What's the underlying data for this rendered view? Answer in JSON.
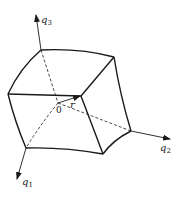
{
  "diagram": {
    "colors": {
      "stroke": "#1a1a1a",
      "background": "#ffffff"
    },
    "axes": [
      {
        "id": "q1",
        "symbol": "q",
        "subscript": "1"
      },
      {
        "id": "q2",
        "symbol": "q",
        "subscript": "2"
      },
      {
        "id": "q3",
        "symbol": "q",
        "subscript": "3"
      }
    ],
    "origin_label": "0",
    "vector_label": "r"
  }
}
